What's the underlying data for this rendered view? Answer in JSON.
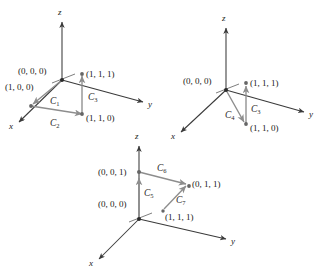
{
  "figure": {
    "type": "math-diagram",
    "background_color": "#ffffff",
    "axis_color": "#3a3a3a",
    "segment_color": "#8d8d8d",
    "label_color": "#1a1a1a"
  },
  "diagrams": [
    {
      "id": "diagram-1",
      "axes": {
        "x": "x",
        "y": "y",
        "z": "z"
      },
      "points": [
        {
          "name": "origin",
          "label": "(0, 0, 0)"
        },
        {
          "name": "point-100",
          "label": "(1, 0, 0)"
        },
        {
          "name": "point-111",
          "label": "(1, 1, 1)"
        },
        {
          "name": "point-110",
          "label": "(1, 1, 0)"
        }
      ],
      "curves": [
        {
          "name": "C1",
          "label": "C",
          "sub": "1"
        },
        {
          "name": "C2",
          "label": "C",
          "sub": "2"
        },
        {
          "name": "C3",
          "label": "C",
          "sub": "3"
        }
      ]
    },
    {
      "id": "diagram-2",
      "axes": {
        "x": "x",
        "y": "y",
        "z": "z"
      },
      "points": [
        {
          "name": "origin",
          "label": "(0, 0, 0)"
        },
        {
          "name": "point-111",
          "label": "(1, 1, 1)"
        },
        {
          "name": "point-110",
          "label": "(1, 1, 0)"
        }
      ],
      "curves": [
        {
          "name": "C4",
          "label": "C",
          "sub": "4"
        },
        {
          "name": "C3",
          "label": "C",
          "sub": "3"
        }
      ]
    },
    {
      "id": "diagram-3",
      "axes": {
        "x": "x",
        "y": "y",
        "z": "z"
      },
      "points": [
        {
          "name": "point-001",
          "label": "(0, 0, 1)"
        },
        {
          "name": "origin",
          "label": "(0, 0, 0)"
        },
        {
          "name": "point-011",
          "label": "(0, 1, 1)"
        },
        {
          "name": "point-111",
          "label": "(1, 1, 1)"
        }
      ],
      "curves": [
        {
          "name": "C5",
          "label": "C",
          "sub": "5"
        },
        {
          "name": "C6",
          "label": "C",
          "sub": "6"
        },
        {
          "name": "C7",
          "label": "C",
          "sub": "7"
        }
      ]
    }
  ]
}
